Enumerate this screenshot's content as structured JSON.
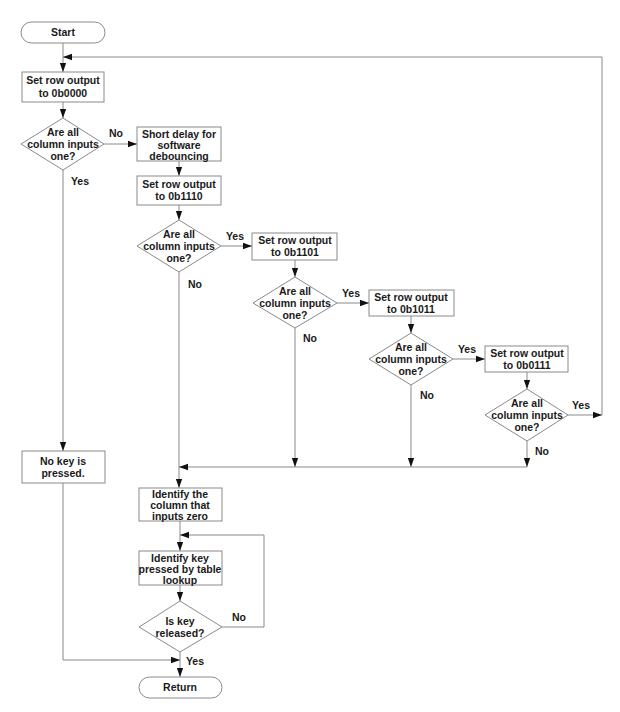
{
  "diagram": {
    "type": "flowchart",
    "nodes": {
      "start": {
        "kind": "terminal",
        "lines": [
          "Start"
        ]
      },
      "set0000": {
        "kind": "process",
        "lines": [
          "Set row output",
          "to 0b0000"
        ]
      },
      "check0": {
        "kind": "decision",
        "lines": [
          "Are all",
          "column inputs",
          "one?"
        ]
      },
      "delay": {
        "kind": "process",
        "lines": [
          "Short delay for",
          "software",
          "debouncing"
        ]
      },
      "set1110": {
        "kind": "process",
        "lines": [
          "Set row output",
          "to 0b1110"
        ]
      },
      "check1": {
        "kind": "decision",
        "lines": [
          "Are all",
          "column inputs",
          "one?"
        ]
      },
      "set1101": {
        "kind": "process",
        "lines": [
          "Set row output",
          "to 0b1101"
        ]
      },
      "check2": {
        "kind": "decision",
        "lines": [
          "Are all",
          "column inputs",
          "one?"
        ]
      },
      "set1011": {
        "kind": "process",
        "lines": [
          "Set row output",
          "to 0b1011"
        ]
      },
      "check3": {
        "kind": "decision",
        "lines": [
          "Are all",
          "column inputs",
          "one?"
        ]
      },
      "set0111": {
        "kind": "process",
        "lines": [
          "Set row output",
          "to 0b0111"
        ]
      },
      "check4": {
        "kind": "decision",
        "lines": [
          "Are all",
          "column inputs",
          "one?"
        ]
      },
      "nokey": {
        "kind": "process",
        "lines": [
          "No key is",
          "pressed."
        ]
      },
      "identcol": {
        "kind": "process",
        "lines": [
          "Identify the",
          "column that",
          "inputs zero"
        ]
      },
      "identkey": {
        "kind": "process",
        "lines": [
          "Identify key",
          "pressed by table",
          "lookup"
        ]
      },
      "released": {
        "kind": "decision",
        "lines": [
          "Is key",
          "released?"
        ]
      },
      "return": {
        "kind": "terminal",
        "lines": [
          "Return"
        ]
      }
    },
    "edge_labels": {
      "check0_no": "No",
      "check0_yes": "Yes",
      "check1_yes": "Yes",
      "check1_no": "No",
      "check2_yes": "Yes",
      "check2_no": "No",
      "check3_yes": "Yes",
      "check3_no": "No",
      "check4_yes": "Yes",
      "check4_no": "No",
      "released_no": "No",
      "released_yes": "Yes"
    },
    "edges": [
      [
        "start",
        "set0000"
      ],
      [
        "set0000",
        "check0"
      ],
      [
        "check0",
        "delay",
        "No"
      ],
      [
        "check0",
        "nokey",
        "Yes"
      ],
      [
        "delay",
        "set1110"
      ],
      [
        "set1110",
        "check1"
      ],
      [
        "check1",
        "set1101",
        "Yes"
      ],
      [
        "check1",
        "identcol",
        "No"
      ],
      [
        "set1101",
        "check2"
      ],
      [
        "check2",
        "set1011",
        "Yes"
      ],
      [
        "check2",
        "identcol",
        "No"
      ],
      [
        "set1011",
        "check3"
      ],
      [
        "check3",
        "set0111",
        "Yes"
      ],
      [
        "check3",
        "identcol",
        "No"
      ],
      [
        "set0111",
        "check4"
      ],
      [
        "check4",
        "set0000",
        "Yes"
      ],
      [
        "check4",
        "identcol",
        "No"
      ],
      [
        "identcol",
        "identkey"
      ],
      [
        "identkey",
        "released"
      ],
      [
        "released",
        "identkey",
        "No"
      ],
      [
        "released",
        "return",
        "Yes"
      ],
      [
        "nokey",
        "return"
      ]
    ]
  }
}
